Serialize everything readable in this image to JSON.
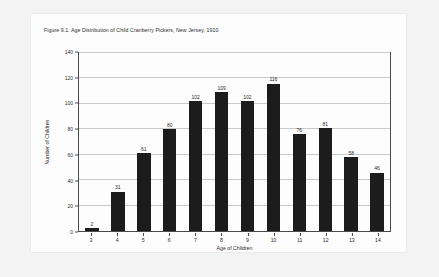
{
  "figure": {
    "title": "Figure 9.1. Age Distribution of Child Cranberry Pickers, New Jersey, 1910"
  },
  "colors": {
    "bar": "#1c1c1c",
    "axis": "#4a4a4a",
    "grid": "#c9c9c9",
    "text": "#2b2b2b",
    "paper": "#fdfdfd",
    "backdrop": "#f3f3f3"
  },
  "chart_data": {
    "type": "bar",
    "title": "Figure 9.1. Age Distribution of Child Cranberry Pickers, New Jersey, 1910",
    "xlabel": "Age of Children",
    "ylabel": "Number of Children",
    "categories": [
      "3",
      "4",
      "5",
      "6",
      "7",
      "8",
      "9",
      "10",
      "11",
      "12",
      "13",
      "14"
    ],
    "values": [
      2,
      31,
      61,
      80,
      102,
      109,
      102,
      116,
      76,
      81,
      58,
      46
    ],
    "data_labels": [
      "2",
      "31",
      "61",
      "80",
      "102",
      "109",
      "102",
      "116",
      "76",
      "81",
      "58",
      "46"
    ],
    "ylim": [
      0,
      140
    ],
    "ytick_labels": [
      "0",
      "20",
      "40",
      "60",
      "80",
      "100",
      "120",
      "140"
    ],
    "ytick_values": [
      0,
      20,
      40,
      60,
      80,
      100,
      120,
      140
    ],
    "grid": "horizontal",
    "legend": "none"
  }
}
